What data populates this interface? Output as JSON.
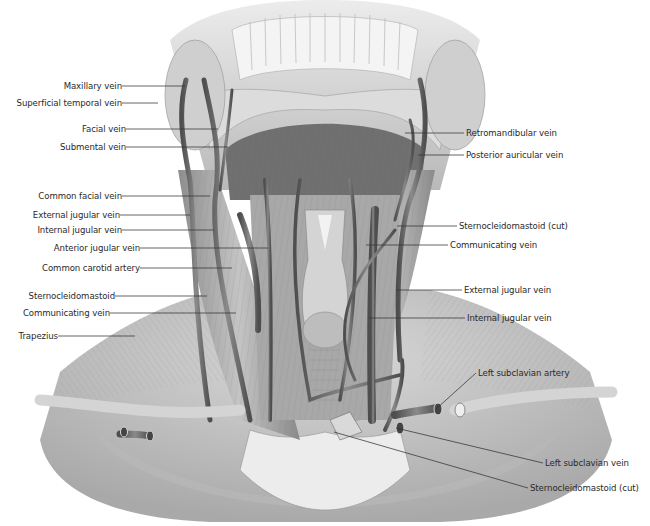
{
  "figure": {
    "colors": {
      "background": "#ffffff",
      "label_text": "#2a2a2a",
      "leader_line": "#333333",
      "muscle_light": "#c9c9c9",
      "muscle_mid": "#9a9a9a",
      "muscle_dark": "#5e5e5e",
      "vessel": "#6a6a6a",
      "bone": "#e6e6e6"
    }
  },
  "labels_left": [
    {
      "id": "maxillary-vein",
      "text": "Maxillary vein",
      "tx": 122,
      "ty": 86,
      "px": 185,
      "py": 86
    },
    {
      "id": "superficial-temporal-vein",
      "text": "Superficial temporal vein",
      "tx": 122,
      "ty": 103,
      "px": 158,
      "py": 103
    },
    {
      "id": "facial-vein",
      "text": "Facial vein",
      "tx": 126,
      "ty": 129,
      "px": 218,
      "py": 129
    },
    {
      "id": "submental-vein",
      "text": "Submental vein",
      "tx": 126,
      "ty": 147,
      "px": 228,
      "py": 147
    },
    {
      "id": "common-facial-vein",
      "text": "Common facial vein",
      "tx": 122,
      "ty": 196,
      "px": 210,
      "py": 196
    },
    {
      "id": "external-jugular-vein-left",
      "text": "External jugular vein",
      "tx": 120,
      "ty": 215,
      "px": 190,
      "py": 215
    },
    {
      "id": "internal-jugular-vein-left",
      "text": "Internal jugular vein",
      "tx": 122,
      "ty": 230,
      "px": 214,
      "py": 230
    },
    {
      "id": "anterior-jugular-vein",
      "text": "Anterior jugular vein",
      "tx": 140,
      "ty": 248,
      "px": 268,
      "py": 248
    },
    {
      "id": "common-carotid-artery",
      "text": "Common carotid artery",
      "tx": 140,
      "ty": 268,
      "px": 232,
      "py": 268
    },
    {
      "id": "sternocleidomastoid-left",
      "text": "Sternocleidomastoid",
      "tx": 115,
      "ty": 296,
      "px": 207,
      "py": 296
    },
    {
      "id": "communicating-vein-left",
      "text": "Communicating vein",
      "tx": 110,
      "ty": 313,
      "px": 236,
      "py": 313
    },
    {
      "id": "trapezius",
      "text": "Trapezius",
      "tx": 58,
      "ty": 336,
      "px": 135,
      "py": 336
    }
  ],
  "labels_right": [
    {
      "id": "retromandibular-vein",
      "text": "Retromandibular vein",
      "tx": 464,
      "ty": 133,
      "px": 405,
      "py": 133
    },
    {
      "id": "posterior-auricular-vein",
      "text": "Posterior auricular vein",
      "tx": 464,
      "ty": 155,
      "px": 418,
      "py": 155
    },
    {
      "id": "sternocleidomastoid-cut-upper",
      "text": "Sternocleidomastoid (cut)",
      "tx": 457,
      "ty": 226,
      "px": 397,
      "py": 226
    },
    {
      "id": "communicating-vein-right",
      "text": "Communicating vein",
      "tx": 448,
      "ty": 245,
      "px": 366,
      "py": 245
    },
    {
      "id": "external-jugular-vein-right",
      "text": "External jugular vein",
      "tx": 462,
      "ty": 290,
      "px": 396,
      "py": 290
    },
    {
      "id": "internal-jugular-vein-right",
      "text": "Internal jugular vein",
      "tx": 465,
      "ty": 318,
      "px": 369,
      "py": 318
    },
    {
      "id": "left-subclavian-artery",
      "text": "Left subclavian artery",
      "tx": 476,
      "ty": 373,
      "px": 436,
      "py": 409
    },
    {
      "id": "left-subclavian-vein",
      "text": "Left subclavian vein",
      "tx": 543,
      "ty": 463,
      "px": 396,
      "py": 428
    },
    {
      "id": "sternocleidomastoid-cut-lower",
      "text": "Sternocleidomastoid (cut)",
      "tx": 528,
      "ty": 488,
      "px": 334,
      "py": 432
    }
  ]
}
